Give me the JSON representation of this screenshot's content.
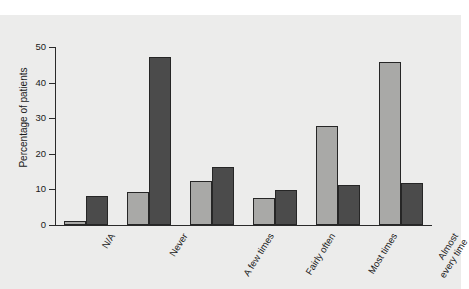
{
  "chart_data": {
    "type": "bar",
    "title": "",
    "subtitle": "",
    "xlabel": "",
    "ylabel": "Percentage of patients",
    "ylim": [
      0,
      50
    ],
    "yticks": [
      0,
      10,
      20,
      30,
      40,
      50
    ],
    "ytick_labels": [
      "0",
      "10",
      "20",
      "30",
      "40",
      "50"
    ],
    "grid": false,
    "legend": "none",
    "categories": [
      "N/A",
      "Never",
      "A few times",
      "Fairly often",
      "Most times",
      "Almost\nevery time"
    ],
    "series": [
      {
        "name": "series-light",
        "color": "#a9a9a7",
        "values": [
          1.2,
          9.2,
          12.4,
          7.5,
          27.7,
          45.7
        ]
      },
      {
        "name": "series-dark",
        "color": "#4b4b4b",
        "values": [
          8.2,
          47.2,
          16.3,
          9.8,
          11.1,
          11.8
        ]
      }
    ]
  },
  "colors": {
    "page_background": "#ffffff",
    "panel_background": "#ececeb",
    "axis": "#2a2a2a",
    "bar_light": "#a9a9a7",
    "bar_dark": "#4b4b4b",
    "bar_edge": "#262626",
    "text": "#1a1a1a"
  }
}
